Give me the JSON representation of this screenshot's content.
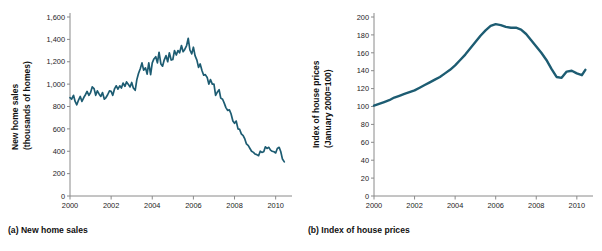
{
  "figure": {
    "background_color": "#ffffff",
    "line_color": "#1d5c72",
    "axis_color": "#8a8a8a",
    "text_color": "#111111"
  },
  "panels": [
    {
      "id": "a",
      "caption": "(a) New home sales",
      "ylabel_line1": "New home sales",
      "ylabel_line2": "(thousands of homes)"
    },
    {
      "id": "b",
      "caption": "(b) Index of house prices",
      "ylabel_line1": "Index of house prices",
      "ylabel_line2": "(January 2000=100)"
    }
  ],
  "chart_data": [
    {
      "type": "line",
      "title": "(a) New home sales",
      "xlabel": "",
      "ylabel": "New home sales (thousands of homes)",
      "xlim": [
        2000,
        2010.6
      ],
      "ylim": [
        0,
        1600
      ],
      "xticks": [
        2000,
        2002,
        2004,
        2006,
        2008,
        2010
      ],
      "xticklabels": [
        "2000",
        "2002",
        "2004",
        "2006",
        "2008",
        "2010"
      ],
      "yticks": [
        0,
        200,
        400,
        600,
        800,
        1000,
        1200,
        1400,
        1600
      ],
      "yticklabels": [
        "0",
        "200",
        "400",
        "600",
        "800",
        "1,000",
        "1,200",
        "1,400",
        "1,600"
      ],
      "grid": false,
      "legend": "none",
      "series": [
        {
          "name": "New home sales",
          "color": "#1d5c72",
          "x": [
            2000.0,
            2000.08,
            2000.17,
            2000.25,
            2000.33,
            2000.42,
            2000.5,
            2000.58,
            2000.67,
            2000.75,
            2000.83,
            2000.92,
            2001.0,
            2001.08,
            2001.17,
            2001.25,
            2001.33,
            2001.42,
            2001.5,
            2001.58,
            2001.67,
            2001.75,
            2001.83,
            2001.92,
            2002.0,
            2002.08,
            2002.17,
            2002.25,
            2002.33,
            2002.42,
            2002.5,
            2002.58,
            2002.67,
            2002.75,
            2002.83,
            2002.92,
            2003.0,
            2003.08,
            2003.17,
            2003.25,
            2003.33,
            2003.42,
            2003.5,
            2003.58,
            2003.67,
            2003.75,
            2003.83,
            2003.92,
            2004.0,
            2004.08,
            2004.17,
            2004.25,
            2004.33,
            2004.42,
            2004.5,
            2004.58,
            2004.67,
            2004.75,
            2004.83,
            2004.92,
            2005.0,
            2005.08,
            2005.17,
            2005.25,
            2005.33,
            2005.42,
            2005.5,
            2005.58,
            2005.67,
            2005.75,
            2005.83,
            2005.92,
            2006.0,
            2006.08,
            2006.17,
            2006.25,
            2006.33,
            2006.42,
            2006.5,
            2006.58,
            2006.67,
            2006.75,
            2006.83,
            2006.92,
            2007.0,
            2007.08,
            2007.17,
            2007.25,
            2007.33,
            2007.42,
            2007.5,
            2007.58,
            2007.67,
            2007.75,
            2007.83,
            2007.92,
            2008.0,
            2008.08,
            2008.17,
            2008.25,
            2008.33,
            2008.42,
            2008.5,
            2008.58,
            2008.67,
            2008.75,
            2008.83,
            2008.92,
            2009.0,
            2009.08,
            2009.17,
            2009.25,
            2009.33,
            2009.42,
            2009.5,
            2009.58,
            2009.67,
            2009.75,
            2009.83,
            2009.92,
            2010.0,
            2010.08,
            2010.17,
            2010.25,
            2010.33,
            2010.42
          ],
          "values": [
            880,
            865,
            900,
            845,
            815,
            860,
            890,
            845,
            880,
            905,
            935,
            900,
            925,
            975,
            960,
            900,
            940,
            910,
            890,
            925,
            865,
            880,
            905,
            940,
            935,
            900,
            960,
            985,
            955,
            985,
            965,
            1010,
            980,
            1020,
            1000,
            975,
            1015,
            965,
            945,
            1040,
            1095,
            1140,
            1190,
            1125,
            1145,
            1090,
            1190,
            1085,
            1190,
            1225,
            1245,
            1190,
            1285,
            1180,
            1160,
            1215,
            1255,
            1200,
            1280,
            1215,
            1220,
            1300,
            1260,
            1300,
            1280,
            1345,
            1290,
            1310,
            1345,
            1410,
            1305,
            1270,
            1330,
            1255,
            1215,
            1150,
            1180,
            1120,
            1080,
            1085,
            1060,
            1000,
            1040,
            1000,
            1000,
            900,
            930,
            950,
            875,
            865,
            830,
            790,
            765,
            770,
            735,
            670,
            650,
            670,
            600,
            595,
            555,
            540,
            510,
            465,
            450,
            425,
            400,
            390,
            375,
            370,
            360,
            400,
            390,
            395,
            440,
            425,
            435,
            410,
            400,
            395,
            385,
            425,
            435,
            395,
            330,
            305
          ]
        }
      ]
    },
    {
      "type": "line",
      "title": "(b) Index of house prices",
      "xlabel": "",
      "ylabel": "Index of house prices (January 2000=100)",
      "xlim": [
        2000,
        2010.6
      ],
      "ylim": [
        0,
        200
      ],
      "xticks": [
        2000,
        2002,
        2004,
        2006,
        2008,
        2010
      ],
      "xticklabels": [
        "2000",
        "2002",
        "2004",
        "2006",
        "2008",
        "2010"
      ],
      "yticks": [
        0,
        20,
        40,
        60,
        80,
        100,
        120,
        140,
        160,
        180,
        200
      ],
      "yticklabels": [
        "0",
        "20",
        "40",
        "60",
        "80",
        "100",
        "120",
        "140",
        "160",
        "180",
        "200"
      ],
      "grid": false,
      "legend": "none",
      "series": [
        {
          "name": "Index of house prices",
          "color": "#1d5c72",
          "x": [
            2000.0,
            2000.25,
            2000.5,
            2000.75,
            2001.0,
            2001.25,
            2001.5,
            2001.75,
            2002.0,
            2002.25,
            2002.5,
            2002.75,
            2003.0,
            2003.25,
            2003.5,
            2003.75,
            2004.0,
            2004.25,
            2004.5,
            2004.75,
            2005.0,
            2005.25,
            2005.5,
            2005.75,
            2006.0,
            2006.25,
            2006.5,
            2006.75,
            2007.0,
            2007.25,
            2007.5,
            2007.75,
            2008.0,
            2008.25,
            2008.5,
            2008.75,
            2009.0,
            2009.25,
            2009.5,
            2009.75,
            2010.0,
            2010.25,
            2010.42
          ],
          "values": [
            101,
            103,
            105,
            107,
            110,
            112,
            114,
            116,
            118,
            121,
            124,
            127,
            130,
            133,
            137,
            141,
            146,
            152,
            158,
            165,
            172,
            179,
            185,
            190,
            192,
            191,
            189,
            188,
            188,
            186,
            181,
            174,
            167,
            160,
            152,
            142,
            133,
            132,
            139,
            140,
            137,
            135,
            141
          ]
        }
      ]
    }
  ]
}
